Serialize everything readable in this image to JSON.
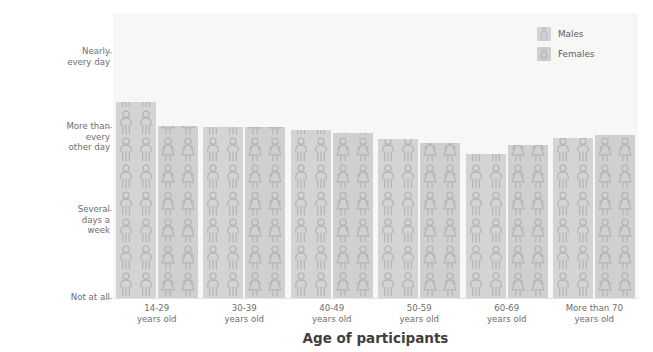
{
  "chart_data": {
    "type": "bar",
    "title": "",
    "subtitle": "",
    "xlabel": "Age of participants",
    "ylabel": "Frequency of procrastination",
    "categories": [
      "14-29\nyears old",
      "30-39\nyears old",
      "40-49\nyears old",
      "50-59\nyears old",
      "60-69\nyears old",
      "More than 70\nyears old"
    ],
    "category_lines": [
      [
        "14-29",
        "years old"
      ],
      [
        "30-39",
        "years old"
      ],
      [
        "40-49",
        "years old"
      ],
      [
        "50-59",
        "years old"
      ],
      [
        "60-69",
        "years old"
      ],
      [
        "More than 70",
        "years old"
      ]
    ],
    "ytick_labels": [
      [
        "Not at all"
      ],
      [
        "Several",
        "days a",
        "week"
      ],
      [
        "More than",
        "every",
        "other day"
      ],
      [
        "Nearly",
        "every day"
      ]
    ],
    "ytick_values": [
      0,
      1,
      2,
      3
    ],
    "ylim": [
      0,
      3.6
    ],
    "grid": false,
    "legend_position": "top-right",
    "series": [
      {
        "name": "Males",
        "color": "#d4d4d4",
        "icon": "male-pictogram",
        "values": [
          2.48,
          2.16,
          2.12,
          2.01,
          1.82,
          2.02
        ]
      },
      {
        "name": "Females",
        "color": "#d0d0d0",
        "icon": "female-pictogram",
        "values": [
          2.17,
          2.16,
          2.09,
          1.96,
          1.93,
          2.06
        ]
      }
    ]
  },
  "legend": {
    "items": [
      {
        "label": "Males",
        "color": "#d4d4d4"
      },
      {
        "label": "Females",
        "color": "#d0d0d0"
      }
    ]
  },
  "colors": {
    "plot_background": "#f7f7f7",
    "page_background": "#ffffff",
    "bar_male": "#d4d4d4",
    "bar_female": "#d0d0d0",
    "pictogram_stroke": "#b5b5b5",
    "axis_text": "#6e6e6e",
    "axis_title": "#3f3f3f",
    "baseline": "#e2e2e2"
  }
}
